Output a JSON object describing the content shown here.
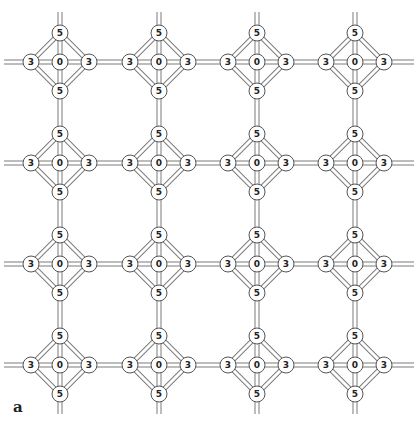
{
  "panel_label": "a",
  "grid": {
    "columns_x": [
      60,
      159,
      257,
      355
    ],
    "rows_y": [
      62,
      163,
      264,
      365
    ],
    "arm_length": 29,
    "node_radius": 8,
    "bar_width": 5,
    "extent": {
      "left": 4,
      "right": 414,
      "top": 12,
      "bottom": 414
    }
  },
  "unit_nodes": {
    "center": "0",
    "top": "5",
    "bottom": "5",
    "left": "3",
    "right": "3"
  },
  "colors": {
    "bar_outline": "#7a7a7a",
    "node_outline": "#555555",
    "label": "#222222",
    "background": "#ffffff"
  }
}
